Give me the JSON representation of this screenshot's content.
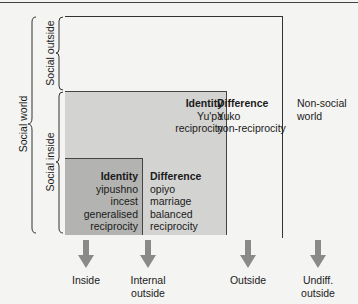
{
  "side_labels": {
    "social_world": "Social world",
    "social_outside": "Social outside",
    "social_inside": "Social inside"
  },
  "inner_box": {
    "identity_title": "Identity",
    "identity_lines": [
      "yipushno",
      "incest",
      "generalised",
      "reciprocity"
    ],
    "difference_title": "Difference",
    "difference_lines": [
      "opiyo",
      "marriage",
      "balanced",
      "reciprocity"
    ]
  },
  "middle_box": {
    "identity_title": "Identity",
    "identity_lines": [
      "Yu'pa",
      "reciprocity"
    ],
    "difference_title": "Difference",
    "difference_lines": [
      "Yuko",
      "non-reciprocity"
    ]
  },
  "outer_region": {
    "lines": [
      "Non-social",
      "world"
    ]
  },
  "arrows": [
    {
      "icon": "down-arrow-icon",
      "label_lines": [
        "Inside"
      ]
    },
    {
      "icon": "down-arrow-icon",
      "label_lines": [
        "Internal",
        "outside"
      ]
    },
    {
      "icon": "down-arrow-icon",
      "label_lines": [
        "Outside"
      ]
    },
    {
      "icon": "down-arrow-icon",
      "label_lines": [
        "Undiff.",
        "outside"
      ]
    }
  ],
  "colors": {
    "background": "#f4f4f2",
    "middle_fill": "#d3d3d1",
    "inner_fill": "#b3b3b1",
    "arrow": "#8a8a88"
  }
}
